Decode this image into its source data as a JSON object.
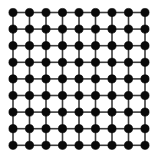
{
  "figure": {
    "name": "square-lattice-graph",
    "title": "",
    "width": 156,
    "height": 154,
    "background_color": "#ffffff"
  },
  "chart_data": {
    "type": "scatter",
    "title": "",
    "xlabel": "",
    "ylabel": "",
    "grid": true,
    "legend": null,
    "graph": {
      "kind": "square-lattice",
      "rows": 9,
      "cols": 9,
      "node_count": 81,
      "edge_count": 144,
      "node_radius": 4.1,
      "node_color": "#0a0a0a",
      "node_edge_color": "#000000",
      "edge_color": "#3c3c3c",
      "edge_width": 1.6,
      "origin_x": 13.0,
      "origin_y": 12.5,
      "spacing_x": 16.5,
      "spacing_y": 16.6
    },
    "x": [
      13,
      29.5,
      46,
      62.5,
      79,
      95.5,
      112,
      128.5,
      145
    ],
    "y": [
      12.5,
      29.1,
      45.7,
      62.3,
      78.9,
      95.5,
      112.1,
      128.7,
      145.3
    ],
    "xlim": [
      0,
      156
    ],
    "ylim": [
      0,
      154
    ],
    "tick_labels_x": [],
    "tick_labels_y": []
  }
}
